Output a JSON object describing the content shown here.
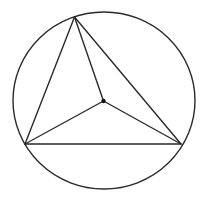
{
  "diagram": {
    "type": "geometry",
    "colors": {
      "line": "#2a2a2a",
      "point": "#111111",
      "background": "#ffffff"
    },
    "circle": {
      "cx": 104,
      "cy": 100.5,
      "rx": 91,
      "ry": 88.5
    },
    "vertices": {
      "A": {
        "x": 74.5,
        "y": 17
      },
      "B": {
        "x": 25,
        "y": 144
      },
      "C": {
        "x": 181,
        "y": 144
      }
    },
    "interior_point": {
      "x": 103.5,
      "y": 101,
      "r": 2.2
    },
    "triangle_sides": [
      [
        "A",
        "B"
      ],
      [
        "B",
        "C"
      ],
      [
        "C",
        "A"
      ]
    ],
    "spokes": [
      [
        "P",
        "A"
      ],
      [
        "P",
        "B"
      ],
      [
        "P",
        "C"
      ]
    ]
  }
}
